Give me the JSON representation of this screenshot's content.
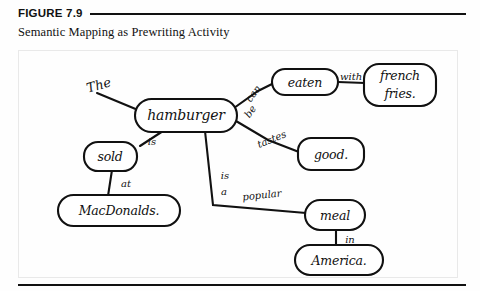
{
  "figure": {
    "number": "FIGURE 7.9",
    "caption": "Semantic Mapping as Prewriting Activity"
  },
  "diagram": {
    "type": "semantic-map",
    "central_node": "hamburger",
    "nodes": [
      {
        "id": "hamburger",
        "label": "hamburger",
        "x": 186,
        "y": 115,
        "rx": 51,
        "ry": 16
      },
      {
        "id": "eaten",
        "label": "eaten",
        "x": 305,
        "y": 82,
        "rx": 33,
        "ry": 13
      },
      {
        "id": "fries",
        "label": "french fries.",
        "line1": "french",
        "line2": "fries.",
        "x": 400,
        "y": 85,
        "rx": 36,
        "ry": 21
      },
      {
        "id": "good",
        "label": "good.",
        "x": 331,
        "y": 154,
        "rx": 33,
        "ry": 16
      },
      {
        "id": "sold",
        "label": "sold",
        "x": 110,
        "y": 156,
        "rx": 26,
        "ry": 14
      },
      {
        "id": "macdonalds",
        "label": "MacDonalds.",
        "x": 119,
        "y": 210,
        "rx": 61,
        "ry": 16
      },
      {
        "id": "meal",
        "label": "meal",
        "x": 335,
        "y": 215,
        "rx": 30,
        "ry": 15
      },
      {
        "id": "america",
        "label": "America.",
        "x": 339,
        "y": 260,
        "rx": 44,
        "ry": 15
      }
    ],
    "edges": [
      {
        "from": "the-label",
        "to": "hamburger",
        "label": "The"
      },
      {
        "from": "hamburger",
        "to": "eaten",
        "label": "can be"
      },
      {
        "from": "eaten",
        "to": "fries",
        "label": "with"
      },
      {
        "from": "hamburger",
        "to": "good",
        "label": "tastes"
      },
      {
        "from": "hamburger",
        "to": "sold",
        "label": "is"
      },
      {
        "from": "sold",
        "to": "macdonalds",
        "label": "at"
      },
      {
        "from": "hamburger",
        "to": "meal",
        "label": "is a popular"
      },
      {
        "from": "meal",
        "to": "america",
        "label": "in"
      }
    ],
    "labels": {
      "the": "The",
      "can": "can",
      "be": "be",
      "with": "with",
      "tastes": "tastes",
      "is": "is",
      "at": "at",
      "is2": "is",
      "a": "a",
      "popular": "popular",
      "in": "in"
    },
    "colors": {
      "ink": "#111111",
      "paper": "#ffffff",
      "frame": "#e9e9e9"
    }
  }
}
